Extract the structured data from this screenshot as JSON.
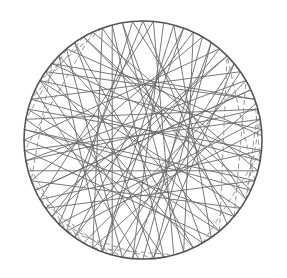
{
  "figure": {
    "colors": {
      "background": "#ffffff",
      "circle": "#555555",
      "solid": "#6a6a6a",
      "dashed": "#8a8a8a"
    },
    "circle": {
      "cx": 143,
      "cy": 140,
      "r": 119
    },
    "solid_chords_deg": [
      [
        100,
        290
      ],
      [
        120,
        330
      ],
      [
        140,
        20
      ],
      [
        160,
        350
      ],
      [
        95,
        230
      ],
      [
        75,
        250
      ],
      [
        60,
        200
      ],
      [
        45,
        215
      ],
      [
        30,
        190
      ],
      [
        15,
        170
      ],
      [
        5,
        150
      ],
      [
        350,
        140
      ],
      [
        335,
        120
      ],
      [
        320,
        110
      ],
      [
        300,
        100
      ],
      [
        285,
        85
      ],
      [
        270,
        60
      ],
      [
        255,
        40
      ],
      [
        240,
        30
      ],
      [
        225,
        10
      ],
      [
        210,
        355
      ],
      [
        195,
        345
      ],
      [
        180,
        320
      ],
      [
        170,
        300
      ],
      [
        150,
        280
      ],
      [
        130,
        260
      ],
      [
        110,
        245
      ],
      [
        90,
        225
      ],
      [
        70,
        235
      ],
      [
        55,
        265
      ],
      [
        40,
        275
      ],
      [
        25,
        205
      ],
      [
        10,
        185
      ],
      [
        355,
        165
      ],
      [
        340,
        175
      ],
      [
        325,
        150
      ],
      [
        310,
        135
      ],
      [
        295,
        125
      ],
      [
        280,
        105
      ],
      [
        265,
        80
      ],
      [
        250,
        70
      ],
      [
        235,
        50
      ],
      [
        220,
        45
      ],
      [
        205,
        25
      ],
      [
        190,
        15
      ],
      [
        175,
        335
      ],
      [
        165,
        310
      ],
      [
        145,
        295
      ],
      [
        125,
        275
      ],
      [
        105,
        255
      ],
      [
        85,
        210
      ],
      [
        65,
        220
      ],
      [
        50,
        180
      ],
      [
        35,
        160
      ],
      [
        20,
        145
      ],
      [
        2,
        130
      ],
      [
        345,
        115
      ],
      [
        330,
        95
      ],
      [
        315,
        90
      ],
      [
        305,
        75
      ],
      [
        290,
        65
      ],
      [
        275,
        55
      ],
      [
        260,
        35
      ],
      [
        245,
        18
      ],
      [
        230,
        5
      ],
      [
        215,
        340
      ],
      [
        200,
        325
      ],
      [
        185,
        305
      ],
      [
        155,
        268
      ],
      [
        135,
        250
      ]
    ],
    "dashed_chords_deg": [
      [
        350,
        20
      ],
      [
        330,
        10
      ],
      [
        320,
        30
      ],
      [
        310,
        45
      ],
      [
        300,
        355
      ],
      [
        340,
        45
      ],
      [
        15,
        330
      ],
      [
        200,
        240
      ],
      [
        210,
        255
      ],
      [
        190,
        230
      ],
      [
        220,
        260
      ],
      [
        120,
        160
      ],
      [
        110,
        150
      ],
      [
        130,
        170
      ],
      [
        140,
        200
      ],
      [
        115,
        185
      ],
      [
        230,
        275
      ],
      [
        245,
        285
      ]
    ]
  }
}
